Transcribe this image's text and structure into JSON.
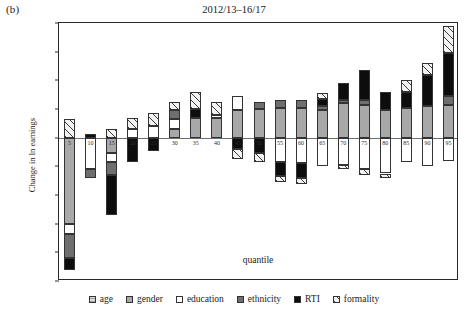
{
  "panel": {
    "label": "(b)"
  },
  "chart_data": {
    "type": "bar",
    "stacked": true,
    "title": "2012/13–16/17",
    "xlabel": "quantile",
    "ylabel": "Change in ln earnings",
    "ylim": [
      -0.5,
      0.4
    ],
    "yticks": [
      0.4,
      0.3,
      0.2,
      0.1,
      0.0,
      -0.1,
      -0.2,
      -0.3,
      -0.4,
      -0.5
    ],
    "ytick_labels": [
      "0.40",
      "0.30",
      "0.20",
      "0.10",
      "0.00",
      "-0.10",
      "-0.20",
      "-0.30",
      "-0.40",
      "-0.50"
    ],
    "grid": false,
    "legend_position": "bottom",
    "categories": [
      "5",
      "10",
      "15",
      "20",
      "25",
      "30",
      "35",
      "40",
      "45",
      "50",
      "55",
      "60",
      "65",
      "70",
      "75",
      "80",
      "85",
      "90",
      "95"
    ],
    "series": [
      {
        "name": "age",
        "color": "#d9d9d9",
        "pattern": "horizontal-lines",
        "values": [
          0.0,
          0.0,
          0.0,
          0.0,
          0.0,
          0.0,
          0.0,
          0.0,
          0.0,
          0.0,
          0.0,
          0.0,
          0.0,
          0.0,
          0.0,
          0.0,
          0.0,
          0.0,
          0.0
        ]
      },
      {
        "name": "gender",
        "color": "#a8a8a8",
        "pattern": "solid",
        "values": [
          -0.3,
          0.0,
          -0.055,
          0.0,
          0.0,
          0.03,
          0.07,
          0.07,
          0.095,
          0.1,
          0.105,
          0.105,
          0.095,
          0.12,
          0.115,
          0.095,
          0.105,
          0.11,
          0.115
        ]
      },
      {
        "name": "education",
        "color": "#ffffff",
        "pattern": "solid",
        "values": [
          -0.035,
          -0.11,
          -0.03,
          0.03,
          0.04,
          0.035,
          0.0,
          0.01,
          0.05,
          0.0,
          -0.085,
          -0.09,
          -0.1,
          -0.095,
          -0.11,
          -0.125,
          -0.085,
          -0.1,
          -0.08
        ]
      },
      {
        "name": "ethnicity",
        "color": "#6e6e6e",
        "pattern": "solid",
        "values": [
          -0.085,
          -0.03,
          -0.045,
          0.0,
          0.0,
          0.03,
          0.0,
          0.0,
          0.0,
          0.025,
          0.025,
          0.025,
          0.015,
          0.01,
          0.015,
          0.0,
          0.0,
          0.0,
          0.03
        ]
      },
      {
        "name": "RTI",
        "color": "#0d0d0d",
        "pattern": "solid",
        "values": [
          -0.04,
          0.012,
          -0.14,
          -0.085,
          -0.045,
          0.0,
          0.03,
          0.0,
          -0.04,
          -0.055,
          -0.05,
          -0.05,
          0.025,
          0.06,
          0.105,
          0.065,
          0.055,
          0.11,
          0.15
        ]
      },
      {
        "name": "formality",
        "color": "#f2f2f2",
        "pattern": "diagonal-hatch",
        "values": [
          0.065,
          0.0,
          0.03,
          0.04,
          0.045,
          0.03,
          0.06,
          0.045,
          -0.035,
          -0.03,
          -0.02,
          -0.02,
          0.02,
          -0.015,
          -0.02,
          -0.015,
          0.04,
          0.04,
          0.095
        ]
      }
    ],
    "legend": [
      {
        "label": "age",
        "swatch": "age-swatch"
      },
      {
        "label": "gender",
        "swatch": "gender-swatch"
      },
      {
        "label": "education",
        "swatch": "education-swatch"
      },
      {
        "label": "ethnicity",
        "swatch": "ethnicity-swatch"
      },
      {
        "label": "RTI",
        "swatch": "rti-swatch"
      },
      {
        "label": "formality",
        "swatch": "formality-swatch"
      }
    ]
  }
}
